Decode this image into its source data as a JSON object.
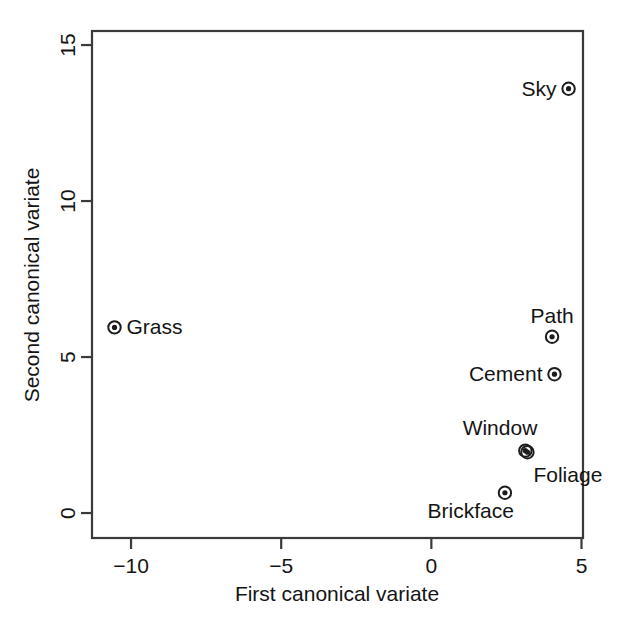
{
  "chart_data": {
    "type": "scatter",
    "title": "",
    "xlabel": "First canonical variate",
    "ylabel": "Second canonical variate",
    "xlim": [
      -11.3,
      5.05
    ],
    "ylim": [
      -0.8,
      15.45
    ],
    "xticks": [
      -10,
      -5,
      0,
      5
    ],
    "xticklabels": [
      "−10",
      "−5",
      "0",
      "5"
    ],
    "yticks": [
      0,
      5,
      10,
      15
    ],
    "yticklabels": [
      "0",
      "5",
      "10",
      "15"
    ],
    "grid": false,
    "legend": "none",
    "marker": "bullseye-circle",
    "points": [
      {
        "label": "Sky",
        "x": 4.57,
        "y": 13.6,
        "label_pos": "left"
      },
      {
        "label": "Grass",
        "x": -10.55,
        "y": 5.95,
        "label_pos": "right"
      },
      {
        "label": "Path",
        "x": 4.02,
        "y": 5.65,
        "label_pos": "above"
      },
      {
        "label": "Cement",
        "x": 4.1,
        "y": 4.45,
        "label_pos": "left"
      },
      {
        "label": "Window",
        "x": 3.13,
        "y": 2.0,
        "label_pos": "above-left"
      },
      {
        "label": "Foliage",
        "x": 3.2,
        "y": 1.95,
        "label_pos": "below-right"
      },
      {
        "label": "Brickface",
        "x": 2.45,
        "y": 0.65,
        "label_pos": "below-left"
      }
    ]
  },
  "plot_area": {
    "left": 92,
    "right": 583,
    "top": 31,
    "bottom": 538
  },
  "axis_labels": {
    "x_title": "First canonical variate",
    "y_title": "Second canonical variate"
  }
}
